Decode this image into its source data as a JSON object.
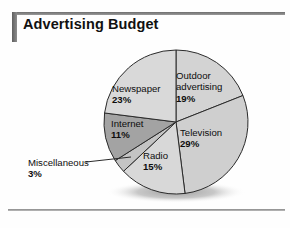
{
  "figure": {
    "title": "Advertising Budget"
  },
  "chart_data": {
    "type": "pie",
    "title": "Advertising Budget",
    "xlabel": "",
    "ylabel": "",
    "units": "percent",
    "total": 100,
    "legend_position": "none",
    "grid": false,
    "categories": [
      "Outdoor advertising",
      "Television",
      "Radio",
      "Miscellaneous",
      "Internet",
      "Newspaper"
    ],
    "values": [
      19,
      29,
      15,
      3,
      11,
      23
    ],
    "slices": [
      {
        "label": "Outdoor advertising",
        "label_line1": "Outdoor",
        "label_line2": "advertising",
        "value": 19,
        "percent_text": "19%",
        "color": "#d3d3d3",
        "callout": false
      },
      {
        "label": "Television",
        "label_line1": "Television",
        "label_line2": "",
        "value": 29,
        "percent_text": "29%",
        "color": "#cfcfcf",
        "callout": false
      },
      {
        "label": "Radio",
        "label_line1": "Radio",
        "label_line2": "",
        "value": 15,
        "percent_text": "15%",
        "color": "#d8d8d8",
        "callout": false
      },
      {
        "label": "Miscellaneous",
        "label_line1": "Miscellaneous",
        "label_line2": "",
        "value": 3,
        "percent_text": "3%",
        "color": "#c4c4c4",
        "callout": true
      },
      {
        "label": "Internet",
        "label_line1": "Internet",
        "label_line2": "",
        "value": 11,
        "percent_text": "11%",
        "color": "#a3a3a3",
        "callout": false
      },
      {
        "label": "Newspaper",
        "label_line1": "Newspaper",
        "label_line2": "",
        "value": 23,
        "percent_text": "23%",
        "color": "#d9d9d9",
        "callout": false
      }
    ]
  }
}
